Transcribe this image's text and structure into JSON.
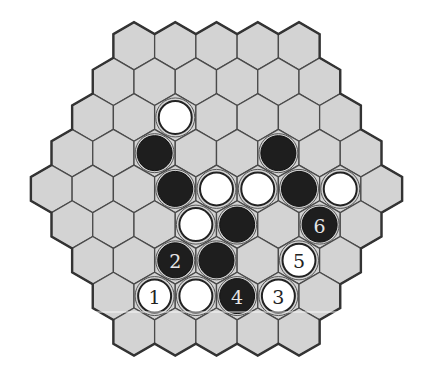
{
  "board": {
    "shape": "hexagonal hex board",
    "row_lengths": [
      5,
      6,
      7,
      8,
      9,
      8,
      7,
      6,
      5
    ],
    "colors": {
      "cell_fill": "#d3d3d3",
      "cell_border": "#4a4a4a",
      "black_stone": "#1e1e1e",
      "white_stone": "#ffffff"
    }
  },
  "stones": [
    {
      "row": 2,
      "col": 2,
      "color": "white",
      "label": ""
    },
    {
      "row": 3,
      "col": 2,
      "color": "black",
      "label": ""
    },
    {
      "row": 3,
      "col": 5,
      "color": "black",
      "label": ""
    },
    {
      "row": 4,
      "col": 3,
      "color": "black",
      "label": ""
    },
    {
      "row": 4,
      "col": 4,
      "color": "white",
      "label": ""
    },
    {
      "row": 4,
      "col": 5,
      "color": "white",
      "label": ""
    },
    {
      "row": 4,
      "col": 6,
      "color": "black",
      "label": ""
    },
    {
      "row": 4,
      "col": 7,
      "color": "white",
      "label": ""
    },
    {
      "row": 5,
      "col": 3,
      "color": "white",
      "label": ""
    },
    {
      "row": 5,
      "col": 4,
      "color": "black",
      "label": ""
    },
    {
      "row": 5,
      "col": 6,
      "color": "black",
      "label": "6"
    },
    {
      "row": 6,
      "col": 2,
      "color": "black",
      "label": "2"
    },
    {
      "row": 6,
      "col": 3,
      "color": "black",
      "label": ""
    },
    {
      "row": 6,
      "col": 5,
      "color": "white",
      "label": "5"
    },
    {
      "row": 7,
      "col": 1,
      "color": "white",
      "label": "1"
    },
    {
      "row": 7,
      "col": 2,
      "color": "white",
      "label": ""
    },
    {
      "row": 7,
      "col": 3,
      "color": "black",
      "label": "4"
    },
    {
      "row": 7,
      "col": 4,
      "color": "white",
      "label": "3"
    }
  ]
}
